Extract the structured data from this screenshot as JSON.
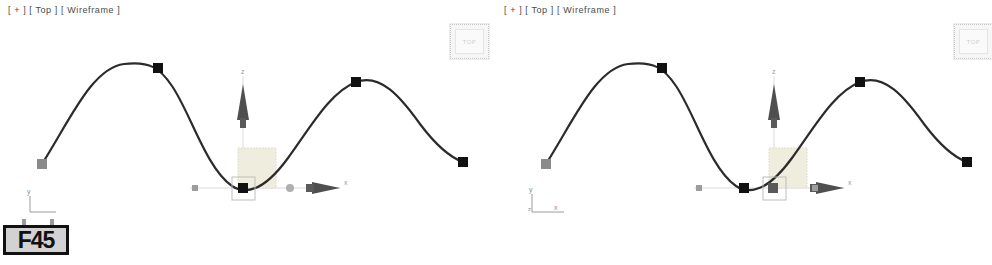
{
  "app": {
    "title": "3D Viewport Comparison",
    "background_color": "#ffffff"
  },
  "viewports": [
    {
      "id": "left",
      "label": "[ + ] [ Top ] [ Wireframe ]",
      "label_parts": {
        "plus": "[ + ]",
        "view": "[ Top ]",
        "shading": "[ Wireframe ]"
      },
      "viewcube": {
        "label": "TOP",
        "border_color": "#c6c6c6",
        "text_color": "#cfcfcf"
      },
      "axis_tripod": {
        "type": "single",
        "labels": [
          "y"
        ],
        "color": "#8d8d8d"
      },
      "gizmo": {
        "type": "move-gizmo",
        "axis_labels": {
          "vertical": "z",
          "horizontal": "x"
        },
        "center_x": 243,
        "center_y": 188,
        "selection_box_x": 232,
        "selection_box_y": 177,
        "plane_handle_color": "#efeede",
        "axis_color": "#595959"
      },
      "spline": {
        "stroke": "#2b2b2b",
        "stroke_width": 2.2,
        "path": "M 42,164 C 70,120 92,68 124,64 C 150,61 160,68 172,86 C 190,112 206,168 232,186 C 252,199 272,180 288,158 C 310,128 330,92 356,82 C 380,73 400,96 420,124 C 438,148 452,158 463,162",
        "vertices": [
          {
            "x": 42,
            "y": 164,
            "style": "gray",
            "label": "start-point"
          },
          {
            "x": 158,
            "y": 68,
            "style": "black",
            "label": "crest-1"
          },
          {
            "x": 243,
            "y": 188,
            "style": "black",
            "label": "trough-selected"
          },
          {
            "x": 356,
            "y": 82,
            "style": "black",
            "label": "crest-2"
          },
          {
            "x": 463,
            "y": 162,
            "style": "black",
            "label": "end-point"
          }
        ]
      }
    },
    {
      "id": "right",
      "label": "[ + ] [ Top ] [ Wireframe ]",
      "label_parts": {
        "plus": "[ + ]",
        "view": "[ Top ]",
        "shading": "[ Wireframe ]"
      },
      "viewcube": {
        "label": "TOP",
        "border_color": "#c6c6c6",
        "text_color": "#cfcfcf"
      },
      "axis_tripod": {
        "type": "corner",
        "labels": [
          "y",
          "z",
          "x"
        ],
        "color": "#8d8d8d"
      },
      "gizmo": {
        "type": "move-gizmo",
        "axis_labels": {
          "vertical": "z",
          "horizontal": "x"
        },
        "center_x": 278,
        "center_y": 188,
        "selection_box_x": 267,
        "selection_box_y": 177,
        "plane_handle_color": "#efeede",
        "axis_color": "#595959"
      },
      "spline": {
        "stroke": "#2b2b2b",
        "stroke_width": 2.2,
        "path": "M 50,164 C 78,120 100,68 132,64 C 158,61 168,68 180,86 C 198,112 214,168 240,186 C 260,199 280,180 296,158 C 318,128 338,92 364,82 C 388,73 408,96 428,124 C 446,148 460,158 471,162",
        "vertices": [
          {
            "x": 50,
            "y": 164,
            "style": "gray",
            "label": "start-point"
          },
          {
            "x": 166,
            "y": 68,
            "style": "black",
            "label": "crest-1"
          },
          {
            "x": 248,
            "y": 188,
            "style": "black",
            "label": "trough-selected"
          },
          {
            "x": 364,
            "y": 82,
            "style": "black",
            "label": "crest-2"
          },
          {
            "x": 471,
            "y": 162,
            "style": "black",
            "label": "end-point"
          }
        ]
      }
    }
  ],
  "frame_badge": {
    "text": "F45",
    "fill_color": "#d2d2d2",
    "border_color": "#111111"
  }
}
